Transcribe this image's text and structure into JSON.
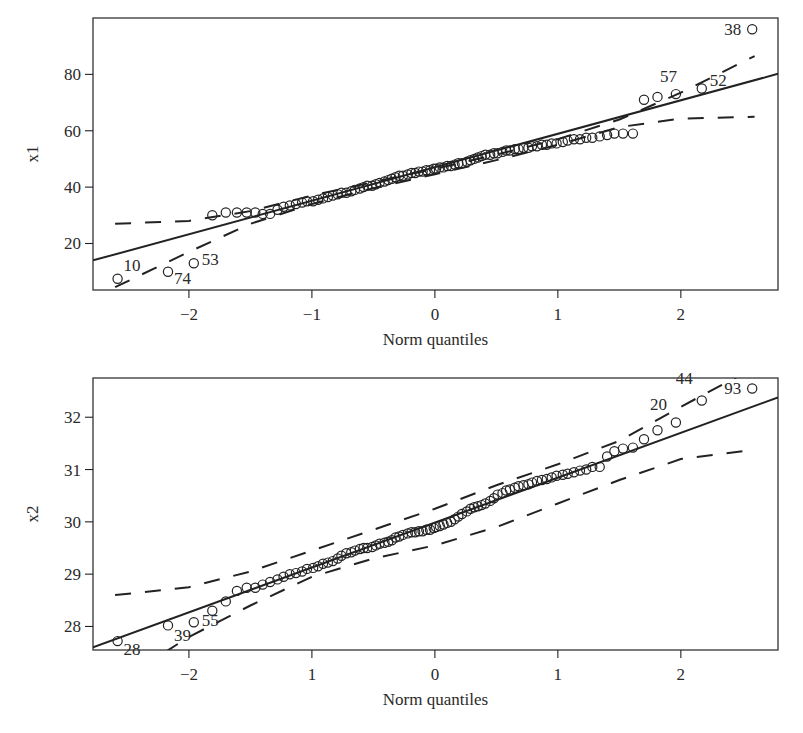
{
  "chart_data": [
    {
      "type": "scatter",
      "subtype": "qq-plot",
      "title": "",
      "xlabel": "Norm quantiles",
      "ylabel": "x1",
      "xlim": [
        -2.78,
        2.79
      ],
      "ylim": [
        3.5,
        100
      ],
      "xticks": [
        -2,
        -1,
        0,
        1,
        2
      ],
      "xtick_labels": [
        "−2",
        "−1",
        "0",
        "1",
        "2"
      ],
      "yticks": [
        20,
        40,
        60,
        80
      ],
      "ytick_labels": [
        "20",
        "40",
        "60",
        "80"
      ],
      "grid": false,
      "reference_line": {
        "x": [
          -2.78,
          2.79
        ],
        "y": [
          14.0,
          80.2
        ]
      },
      "envelope_upper": {
        "x": [
          -2.6,
          -2.0,
          -1.5,
          -1.0,
          -0.5,
          0.0,
          0.5,
          1.0,
          1.5,
          2.0,
          2.6
        ],
        "y": [
          27.0,
          28.0,
          31.5,
          37.0,
          41.8,
          46.5,
          51.5,
          57.0,
          64.0,
          73.5,
          86.5
        ]
      },
      "envelope_lower": {
        "x": [
          -2.6,
          -2.0,
          -1.5,
          -1.0,
          -0.5,
          0.0,
          0.5,
          1.0,
          1.5,
          2.0,
          2.6
        ],
        "y": [
          4.5,
          17.0,
          27.0,
          34.0,
          39.6,
          44.6,
          49.6,
          55.0,
          61.3,
          64.3,
          65.0
        ]
      },
      "points": {
        "x": [
          -2.58,
          -2.17,
          -1.96,
          -1.81,
          -1.7,
          -1.61,
          -1.53,
          -1.46,
          -1.4,
          -1.34,
          -1.28,
          -1.23,
          -1.18,
          -1.13,
          -1.08,
          -1.04,
          -0.99,
          -0.95,
          -0.91,
          -0.87,
          -0.83,
          -0.79,
          -0.76,
          -0.72,
          -0.68,
          -0.65,
          -0.61,
          -0.58,
          -0.55,
          -0.51,
          -0.48,
          -0.45,
          -0.41,
          -0.38,
          -0.35,
          -0.32,
          -0.29,
          -0.26,
          -0.22,
          -0.19,
          -0.16,
          -0.13,
          -0.1,
          -0.07,
          -0.04,
          -0.01,
          0.01,
          0.04,
          0.07,
          0.1,
          0.13,
          0.16,
          0.19,
          0.22,
          0.26,
          0.29,
          0.32,
          0.35,
          0.38,
          0.41,
          0.45,
          0.48,
          0.51,
          0.55,
          0.58,
          0.61,
          0.65,
          0.68,
          0.72,
          0.76,
          0.79,
          0.83,
          0.87,
          0.91,
          0.95,
          0.99,
          1.04,
          1.08,
          1.13,
          1.18,
          1.23,
          1.28,
          1.34,
          1.4,
          1.46,
          1.53,
          1.61,
          1.7,
          1.81,
          1.96,
          2.17,
          2.58
        ],
        "y": [
          7.5,
          10.0,
          13.0,
          30.0,
          31.0,
          31.0,
          31.0,
          31.0,
          30.5,
          30.5,
          32.0,
          33.0,
          33.5,
          34.0,
          34.5,
          35.0,
          35.0,
          35.5,
          36.0,
          36.5,
          37.0,
          37.5,
          38.0,
          38.0,
          38.5,
          39.0,
          39.5,
          40.0,
          40.5,
          40.5,
          41.0,
          41.5,
          42.0,
          42.5,
          43.0,
          43.5,
          44.0,
          44.0,
          44.5,
          45.0,
          45.0,
          45.5,
          45.5,
          46.0,
          46.0,
          46.5,
          46.5,
          47.0,
          47.0,
          47.5,
          47.5,
          48.0,
          48.5,
          48.5,
          49.0,
          49.5,
          50.0,
          50.5,
          51.0,
          51.5,
          51.5,
          52.0,
          52.0,
          52.5,
          53.0,
          53.0,
          53.5,
          53.5,
          54.0,
          54.0,
          54.5,
          54.5,
          55.0,
          55.0,
          55.5,
          55.5,
          56.0,
          56.5,
          57.0,
          57.0,
          57.5,
          57.5,
          58.0,
          58.5,
          59.0,
          59.0,
          59.0,
          71.0,
          72.0,
          73.0,
          75.0,
          96.0
        ]
      },
      "annotations": [
        {
          "text": "10",
          "x": -2.58,
          "y": 7.5
        },
        {
          "text": "74",
          "x": -2.17,
          "y": 10.0
        },
        {
          "text": "53",
          "x": -1.96,
          "y": 13.0
        },
        {
          "text": "57",
          "x": 1.96,
          "y": 73.0
        },
        {
          "text": "52",
          "x": 2.17,
          "y": 75.0
        },
        {
          "text": "38",
          "x": 2.58,
          "y": 96.0
        }
      ]
    },
    {
      "type": "scatter",
      "subtype": "qq-plot",
      "title": "",
      "xlabel": "Norm quantiles",
      "ylabel": "x2",
      "xlim": [
        -2.78,
        2.79
      ],
      "ylim": [
        27.55,
        32.75
      ],
      "xticks": [
        -2,
        -1,
        0,
        1,
        2
      ],
      "xtick_labels": [
        "−2",
        "1",
        "0",
        "1",
        "2"
      ],
      "yticks": [
        28,
        29,
        30,
        31,
        32
      ],
      "ytick_labels": [
        "28",
        "29",
        "30",
        "31",
        "32"
      ],
      "grid": false,
      "reference_line": {
        "x": [
          -2.78,
          2.79
        ],
        "y": [
          27.6,
          32.38
        ]
      },
      "envelope_upper": {
        "x": [
          -2.6,
          -2.0,
          -1.5,
          -1.0,
          -0.5,
          0.0,
          0.5,
          1.0,
          1.5,
          2.0,
          2.6
        ],
        "y": [
          28.6,
          28.75,
          29.05,
          29.45,
          29.85,
          30.25,
          30.7,
          31.1,
          31.55,
          32.2,
          32.95
        ]
      },
      "envelope_lower": {
        "x": [
          -2.2,
          -2.0,
          -1.5,
          -1.0,
          -0.5,
          0.0,
          0.5,
          1.0,
          1.5,
          2.0,
          2.6
        ],
        "y": [
          27.5,
          27.8,
          28.4,
          28.95,
          29.3,
          29.55,
          29.9,
          30.35,
          30.8,
          31.2,
          31.38
        ]
      },
      "points": {
        "x": [
          -2.58,
          -2.17,
          -1.96,
          -1.81,
          -1.7,
          -1.61,
          -1.53,
          -1.46,
          -1.4,
          -1.34,
          -1.28,
          -1.23,
          -1.18,
          -1.13,
          -1.08,
          -1.04,
          -0.99,
          -0.95,
          -0.91,
          -0.87,
          -0.83,
          -0.79,
          -0.76,
          -0.72,
          -0.68,
          -0.65,
          -0.61,
          -0.58,
          -0.55,
          -0.51,
          -0.48,
          -0.45,
          -0.41,
          -0.38,
          -0.35,
          -0.32,
          -0.29,
          -0.26,
          -0.22,
          -0.19,
          -0.16,
          -0.13,
          -0.1,
          -0.07,
          -0.04,
          -0.01,
          0.01,
          0.04,
          0.07,
          0.1,
          0.13,
          0.16,
          0.19,
          0.22,
          0.26,
          0.29,
          0.32,
          0.35,
          0.38,
          0.41,
          0.45,
          0.48,
          0.51,
          0.55,
          0.58,
          0.61,
          0.65,
          0.68,
          0.72,
          0.76,
          0.79,
          0.83,
          0.87,
          0.91,
          0.95,
          0.99,
          1.04,
          1.08,
          1.13,
          1.18,
          1.23,
          1.28,
          1.34,
          1.4,
          1.46,
          1.53,
          1.61,
          1.7,
          1.81,
          1.96,
          2.17,
          2.58
        ],
        "y": [
          27.72,
          28.02,
          28.08,
          28.3,
          28.48,
          28.68,
          28.74,
          28.74,
          28.8,
          28.85,
          28.9,
          28.95,
          29.0,
          29.02,
          29.05,
          29.1,
          29.12,
          29.15,
          29.2,
          29.22,
          29.25,
          29.3,
          29.35,
          29.4,
          29.42,
          29.45,
          29.48,
          29.5,
          29.5,
          29.52,
          29.55,
          29.58,
          29.6,
          29.62,
          29.65,
          29.7,
          29.72,
          29.75,
          29.78,
          29.8,
          29.8,
          29.82,
          29.82,
          29.85,
          29.85,
          29.88,
          29.9,
          29.92,
          29.95,
          29.98,
          30.0,
          30.05,
          30.1,
          30.15,
          30.2,
          30.25,
          30.28,
          30.3,
          30.32,
          30.35,
          30.4,
          30.45,
          30.52,
          30.55,
          30.6,
          30.62,
          30.65,
          30.68,
          30.7,
          30.72,
          30.75,
          30.78,
          30.8,
          30.82,
          30.85,
          30.88,
          30.9,
          30.92,
          30.95,
          30.98,
          31.0,
          31.05,
          31.05,
          31.25,
          31.35,
          31.4,
          31.42,
          31.58,
          31.75,
          31.9,
          32.32,
          32.55
        ]
      },
      "annotations": [
        {
          "text": "28",
          "x": -2.58,
          "y": 27.72
        },
        {
          "text": "39",
          "x": -2.17,
          "y": 28.02
        },
        {
          "text": "55",
          "x": -1.96,
          "y": 28.08
        },
        {
          "text": "20",
          "x": 1.96,
          "y": 31.9
        },
        {
          "text": "44",
          "x": 2.17,
          "y": 32.32
        },
        {
          "text": "93",
          "x": 2.58,
          "y": 32.55
        }
      ]
    }
  ],
  "panels": [
    {
      "xlabel": "Norm quantiles",
      "ylabel": "x1"
    },
    {
      "xlabel": "Norm quantiles",
      "ylabel": "x2"
    }
  ],
  "layout": {
    "panels": [
      {
        "left": 93,
        "top": 18,
        "right": 778,
        "bottom": 290,
        "label_offsets": [
          [
            6,
            -8
          ],
          [
            6,
            12
          ],
          [
            8,
            2
          ],
          [
            -16,
            -12
          ],
          [
            8,
            -2
          ],
          [
            -28,
            6
          ]
        ],
        "label_anchor": [
          "start",
          "start",
          "start",
          "start",
          "start",
          "start"
        ]
      },
      {
        "left": 93,
        "top": 378,
        "right": 778,
        "bottom": 650,
        "label_offsets": [
          [
            6,
            14
          ],
          [
            6,
            16
          ],
          [
            8,
            4
          ],
          [
            -26,
            -12
          ],
          [
            -26,
            -16
          ],
          [
            -28,
            6
          ]
        ],
        "label_anchor": [
          "start",
          "start",
          "start",
          "start",
          "start",
          "start"
        ]
      }
    ],
    "colors": {
      "ink": "#222222",
      "frame": "#333333",
      "background": "#ffffff"
    }
  }
}
